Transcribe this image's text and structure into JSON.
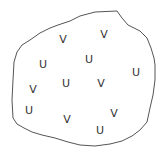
{
  "diagram": {
    "type": "region-with-labels",
    "outline_color": "#555555",
    "background": "#ffffff",
    "outline_points": [
      [
        13,
        118
      ],
      [
        12,
        100
      ],
      [
        13,
        80
      ],
      [
        14,
        62
      ],
      [
        17,
        52
      ],
      [
        22,
        45
      ],
      [
        30,
        40
      ],
      [
        40,
        33
      ],
      [
        50,
        28
      ],
      [
        58,
        25
      ],
      [
        70,
        21
      ],
      [
        80,
        16
      ],
      [
        95,
        12
      ],
      [
        117,
        11
      ],
      [
        122,
        18
      ],
      [
        128,
        25
      ],
      [
        140,
        31
      ],
      [
        147,
        38
      ],
      [
        151,
        48
      ],
      [
        154,
        58
      ],
      [
        155,
        65
      ],
      [
        155,
        80
      ],
      [
        153,
        95
      ],
      [
        150,
        108
      ],
      [
        147,
        122
      ],
      [
        140,
        130
      ],
      [
        132,
        136
      ],
      [
        122,
        141
      ],
      [
        110,
        144
      ],
      [
        95,
        146
      ],
      [
        80,
        145
      ],
      [
        68,
        142
      ],
      [
        55,
        138
      ],
      [
        42,
        135
      ],
      [
        32,
        132
      ],
      [
        24,
        128
      ],
      [
        17,
        124
      ]
    ],
    "labels": [
      {
        "text": "V",
        "x": 63,
        "y": 39
      },
      {
        "text": "V",
        "x": 104,
        "y": 34
      },
      {
        "text": "U",
        "x": 43,
        "y": 64
      },
      {
        "text": "U",
        "x": 89,
        "y": 59
      },
      {
        "text": "U",
        "x": 136,
        "y": 72
      },
      {
        "text": "V",
        "x": 33,
        "y": 89
      },
      {
        "text": "U",
        "x": 66,
        "y": 83
      },
      {
        "text": "V",
        "x": 101,
        "y": 83
      },
      {
        "text": "U",
        "x": 29,
        "y": 110
      },
      {
        "text": "V",
        "x": 67,
        "y": 119
      },
      {
        "text": "V",
        "x": 114,
        "y": 113
      },
      {
        "text": "U",
        "x": 100,
        "y": 130
      }
    ]
  }
}
